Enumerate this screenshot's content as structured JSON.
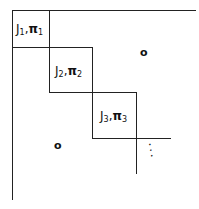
{
  "diagram": {
    "blocks": [
      {
        "label_main": "J",
        "label_sub": "1",
        "label_sep": ",",
        "label_pi": "π",
        "label_pi_sub": "1"
      },
      {
        "label_main": "J",
        "label_sub": "2",
        "label_sep": ",",
        "label_pi": "π",
        "label_pi_sub": "2"
      },
      {
        "label_main": "J",
        "label_sub": "3",
        "label_sep": ",",
        "label_pi": "π",
        "label_pi_sub": "3"
      }
    ],
    "upper_zero": "o",
    "lower_zero": "o",
    "continuation": "⋱"
  }
}
